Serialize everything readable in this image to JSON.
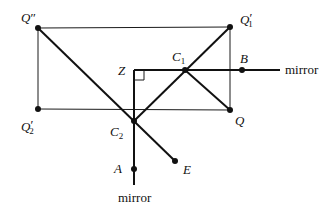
{
  "diagram": {
    "type": "optics-mirror-reflection",
    "colors": {
      "ink": "#111111",
      "background": "#ffffff"
    },
    "points": {
      "Q_double_prime": {
        "label": "Q",
        "mark": "″",
        "sub": "",
        "x": 38,
        "y": 28
      },
      "Q1_prime": {
        "label": "Q",
        "mark": "′",
        "sub": "1",
        "x": 230,
        "y": 27
      },
      "Q2_prime": {
        "label": "Q",
        "mark": "′",
        "sub": "2",
        "x": 38,
        "y": 109
      },
      "Q": {
        "label": "Q",
        "x": 230,
        "y": 110
      },
      "Z": {
        "label": "Z",
        "x": 134,
        "y": 70
      },
      "C1": {
        "label": "C",
        "sub": "1",
        "x": 185,
        "y": 70
      },
      "C2": {
        "label": "C",
        "sub": "2",
        "x": 134,
        "y": 121
      },
      "B": {
        "label": "B",
        "x": 242,
        "y": 70
      },
      "A": {
        "label": "A",
        "x": 134,
        "y": 169
      },
      "E": {
        "label": "E",
        "x": 175,
        "y": 161
      }
    },
    "mirrors": {
      "horizontal": {
        "label": "mirror"
      },
      "vertical": {
        "label": "mirror"
      }
    },
    "right_angle_marker_at": "Z"
  }
}
